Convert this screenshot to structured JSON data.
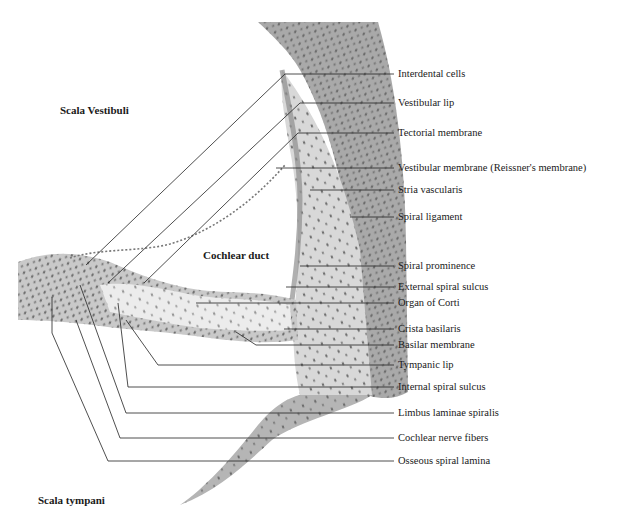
{
  "figure": {
    "colors": {
      "background": "#ffffff",
      "tissue_dark": "#9a9a9a",
      "tissue_mid": "#c4c4c4",
      "tissue_light": "#e2e2e2",
      "nuclei": "#555555",
      "leader_line": "#222222",
      "text": "#1a1a1a"
    },
    "region_labels": {
      "scala_vestibuli": "Scala Vestibuli",
      "cochlear_duct": "Cochlear duct",
      "scala_tympani": "Scala tympani"
    },
    "callouts": [
      {
        "label": "Interdental cells",
        "y": 74
      },
      {
        "label": "Vestibular lip",
        "y": 103
      },
      {
        "label": "Tectorial membrane",
        "y": 133
      },
      {
        "label": "Vestibular membrane (Reissner's membrane)",
        "y": 168
      },
      {
        "label": "Stria vascularis",
        "y": 190
      },
      {
        "label": "Spiral ligament",
        "y": 217
      },
      {
        "label": "Spiral prominence",
        "y": 266
      },
      {
        "label": "External spiral sulcus",
        "y": 287
      },
      {
        "label": "Organ of Corti",
        "y": 303
      },
      {
        "label": "Crista basilaris",
        "y": 329
      },
      {
        "label": "Basilar membrane",
        "y": 345
      },
      {
        "label": "Tympanic lip",
        "y": 365
      },
      {
        "label": "Internal spiral sulcus",
        "y": 387
      },
      {
        "label": "Limbus laminae spiralis",
        "y": 413
      },
      {
        "label": "Cochlear nerve fibers",
        "y": 438
      },
      {
        "label": "Osseous spiral lamina",
        "y": 461
      }
    ]
  }
}
